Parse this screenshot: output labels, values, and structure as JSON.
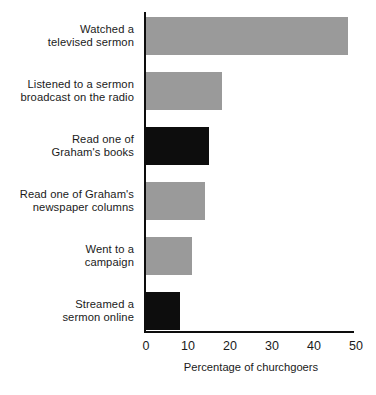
{
  "chart_data": {
    "type": "bar",
    "orientation": "horizontal",
    "title": "",
    "subtitle": "",
    "xlabel": "Percentage of churchgoers",
    "ylabel": "",
    "xlim": [
      0,
      50
    ],
    "xticks": [
      0,
      10,
      20,
      30,
      40,
      50
    ],
    "xtick_labels": [
      "0",
      "10",
      "20",
      "30",
      "40",
      "50"
    ],
    "grid": false,
    "legend": null,
    "categories": [
      "Watched a televised sermon",
      "Listened to a sermon broadcast on the radio",
      "Read one of Graham's books",
      "Read one of Graham's newspaper columns",
      "Went to a campaign",
      "Streamed a sermon online"
    ],
    "values": [
      48,
      18,
      15,
      14,
      11,
      8
    ],
    "bar_colors": [
      "#9a9a9a",
      "#9a9a9a",
      "#0d0d0d",
      "#9a9a9a",
      "#9a9a9a",
      "#0d0d0d"
    ],
    "bars": [
      {
        "label_lines": [
          "Watched a",
          "televised sermon"
        ],
        "value": 48,
        "color": "#9a9a9a",
        "highlighted": false
      },
      {
        "label_lines": [
          "Listened to a sermon",
          "broadcast on the radio"
        ],
        "value": 18,
        "color": "#9a9a9a",
        "highlighted": false
      },
      {
        "label_lines": [
          "Read one of",
          "Graham's books"
        ],
        "value": 15,
        "color": "#0d0d0d",
        "highlighted": true
      },
      {
        "label_lines": [
          "Read one of Graham's",
          "newspaper columns"
        ],
        "value": 14,
        "color": "#9a9a9a",
        "highlighted": false
      },
      {
        "label_lines": [
          "Went to a",
          "campaign"
        ],
        "value": 11,
        "color": "#9a9a9a",
        "highlighted": false
      },
      {
        "label_lines": [
          "Streamed a",
          "sermon online"
        ],
        "value": 8,
        "color": "#0d0d0d",
        "highlighted": true
      }
    ]
  },
  "colors": {
    "bar_gray": "#9a9a9a",
    "bar_black": "#0d0d0d",
    "axis": "#0d0d0d",
    "text": "#1a1a1a",
    "background": "#ffffff"
  }
}
